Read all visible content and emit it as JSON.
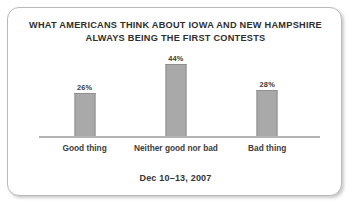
{
  "card": {
    "title_lines": [
      "WHAT AMERICANS THINK ABOUT IOWA AND NEW HAMPSHIRE",
      "ALWAYS BEING THE FIRST CONTESTS"
    ],
    "footer_note": "Dec 10–13, 2007",
    "border_color": "#b9b9b9",
    "background_color": "#ffffff"
  },
  "chart_data": {
    "type": "bar",
    "title": "WHAT AMERICANS THINK ABOUT IOWA AND NEW HAMPSHIRE ALWAYS BEING THE FIRST CONTESTS",
    "subtitle": "Dec 10–13, 2007",
    "xlabel": "",
    "ylabel": "",
    "ylim": [
      0,
      50
    ],
    "grid": false,
    "legend": false,
    "bar_color": "#a9a9a9",
    "bar_border_color": "#8f8f8f",
    "axis_color": "#b3b3b3",
    "categories": [
      "Good thing",
      "Neither good nor bad",
      "Bad thing"
    ],
    "values": [
      26,
      44,
      28
    ],
    "value_labels": [
      "26%",
      "44%",
      "28%"
    ]
  }
}
